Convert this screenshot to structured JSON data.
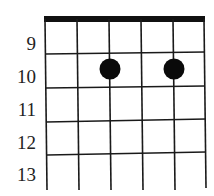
{
  "diagram": {
    "type": "chord-fretboard",
    "strings": 6,
    "nut": true,
    "fret_labels": [
      "9",
      "10",
      "11",
      "12",
      "13"
    ],
    "finger_positions": [
      {
        "string": 3,
        "fret": "10"
      },
      {
        "string": 5,
        "fret": "10"
      }
    ],
    "colors": {
      "line": "#1a1a1a",
      "dot": "#0a0a0a",
      "background": "#ffffff"
    }
  }
}
